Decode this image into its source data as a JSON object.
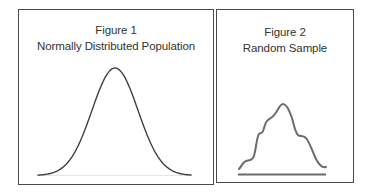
{
  "figures": [
    {
      "label": "Figure 1",
      "title": "Normally Distributed Population",
      "curve": "normal-distribution-bell-curve"
    },
    {
      "label": "Figure 2",
      "title": "Random Sample",
      "curve": "irregular-sample-distribution"
    }
  ],
  "colors": {
    "frame": "#4a4a4a",
    "text": "#333333",
    "population_curve": "#3f3f3f",
    "sample_curve": "#6b6b6b",
    "sample_baseline": "#6b6b6b"
  }
}
